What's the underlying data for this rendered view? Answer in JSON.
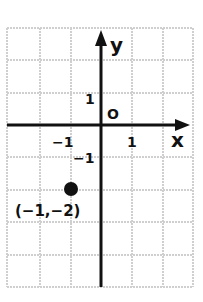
{
  "diagram": {
    "type": "coordinate-plane",
    "grid": {
      "x_min": -3,
      "x_max": 3,
      "y_min": -5,
      "y_max": 3
    },
    "axes": {
      "x_label": "x",
      "y_label": "y",
      "origin_label": "O",
      "tick_labels": {
        "x_pos": "1",
        "x_neg": "−1",
        "y_pos": "1",
        "y_neg": "−1"
      }
    },
    "point": {
      "x": -1,
      "y": -2,
      "label": "(−1,−2)"
    },
    "colors": {
      "grid": "#cfcfcf",
      "axis": "#111111",
      "point": "#111111"
    }
  }
}
